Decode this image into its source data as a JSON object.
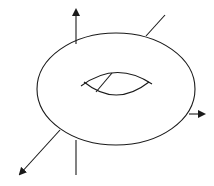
{
  "diagram": {
    "colors": {
      "background": "#ffffff",
      "stroke": "#1a1a1a"
    },
    "torus": {
      "outer": {
        "cx": 116,
        "cy": 89,
        "rx": 79,
        "ry": 56
      },
      "hole_upper_arc": "M 81 86 Q 116 60 152 84",
      "hole_lower_arc": "M 84 82 Q 116 108 149 82",
      "hole_radius_line": {
        "x1": 112,
        "y1": 73,
        "x2": 96,
        "y2": 92
      }
    },
    "axes": [
      {
        "name": "z-axis-up",
        "x1": 76,
        "y1": 44,
        "x2": 76,
        "y2": 10,
        "arrow": true
      },
      {
        "name": "z-axis-down",
        "x1": 76,
        "y1": 140,
        "x2": 76,
        "y2": 175,
        "arrow": false
      },
      {
        "name": "diagonal-axis-back",
        "x1": 146,
        "y1": 36,
        "x2": 165,
        "y2": 15,
        "arrow": false
      },
      {
        "name": "x-axis-right",
        "x1": 189,
        "y1": 114,
        "x2": 204,
        "y2": 114,
        "arrow": true
      },
      {
        "name": "y-axis-front",
        "x1": 60,
        "y1": 130,
        "x2": 20,
        "y2": 174,
        "arrow": true
      }
    ]
  }
}
